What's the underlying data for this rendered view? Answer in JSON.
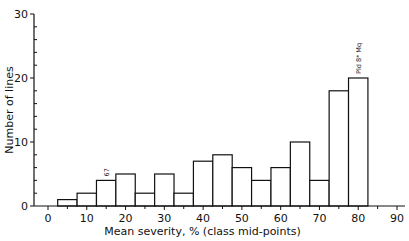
{
  "chart_data": {
    "type": "bar",
    "subtype": "histogram",
    "title": "",
    "xlabel": "Mean severity, % (class mid-points)",
    "ylabel": "Number of lines",
    "xlim": [
      -5,
      92
    ],
    "ylim": [
      0,
      30
    ],
    "x_ticks": [
      0,
      10,
      20,
      30,
      40,
      50,
      60,
      70,
      80,
      90
    ],
    "y_ticks": [
      0,
      10,
      20,
      30
    ],
    "bin_width": 5,
    "categories": [
      5,
      10,
      15,
      20,
      25,
      30,
      35,
      40,
      45,
      50,
      55,
      60,
      65,
      70,
      75,
      80
    ],
    "values": [
      1,
      2,
      4,
      5,
      2,
      5,
      2,
      7,
      8,
      6,
      4,
      6,
      10,
      4,
      18,
      20
    ],
    "annotations": [
      {
        "x": 15,
        "text": "67",
        "rotated": true
      },
      {
        "x": 80,
        "text": "Pld 8* Mq",
        "rotated": true
      }
    ],
    "grid": false,
    "legend": null
  }
}
